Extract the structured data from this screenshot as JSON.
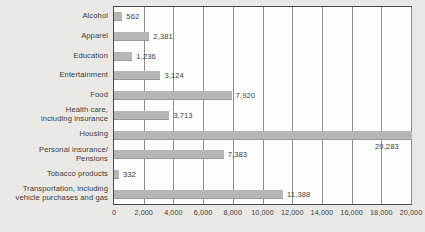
{
  "chart_data": {
    "type": "bar",
    "orientation": "horizontal",
    "title": "",
    "xlabel": "",
    "ylabel": "",
    "xlim": [
      0,
      20000
    ],
    "xticks": [
      "0",
      "2,000",
      "4,000",
      "6,000",
      "8,000",
      "10,000",
      "12,000",
      "14,000",
      "16,000",
      "18,000",
      "20,000"
    ],
    "xtick_values": [
      0,
      2000,
      4000,
      6000,
      8000,
      10000,
      12000,
      14000,
      16000,
      18000,
      20000
    ],
    "grid": "vertical",
    "legend": "none",
    "bar_color": "#b6b6b6",
    "plot_background": "#fdfdfc",
    "page_background": "#e9e8e5",
    "categories": [
      "Alcohol",
      "Apparel",
      "Education",
      "Entertainment",
      "Food",
      "Health care,\nincluding insurance",
      "Housing",
      "Personal insurance/\nPensions",
      "Tobacco products",
      "Transportation, including\nvehicle purchases and gas"
    ],
    "values": [
      562,
      2381,
      1236,
      3124,
      7920,
      3713,
      20283,
      7383,
      332,
      11388
    ],
    "value_labels": [
      "562",
      "2,381",
      "1,236",
      "3,124",
      "7,920",
      "3,713",
      "20,283",
      "7,383",
      "332",
      "11,388"
    ]
  }
}
